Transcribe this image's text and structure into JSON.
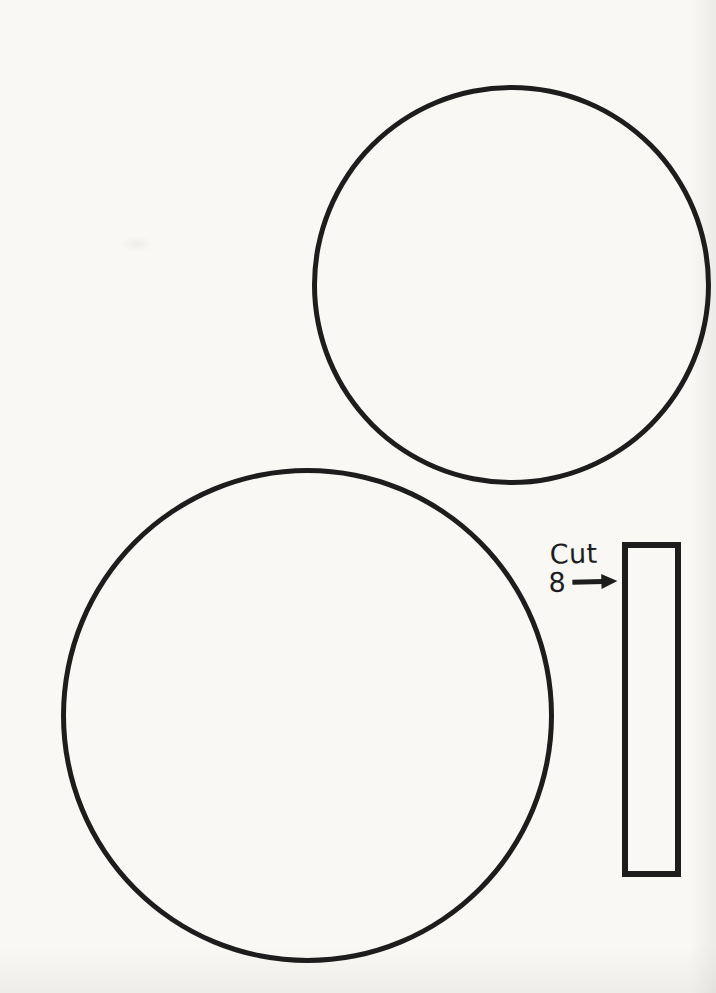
{
  "colors": {
    "paper": "#f9f8f5",
    "ink": "#1d1d1d"
  },
  "annotation": {
    "word": "Cut",
    "count": "8"
  },
  "pieces": {
    "top_circle": "blank circular pattern piece (smaller)",
    "bottom_circle": "blank circular pattern piece (larger)",
    "strip": "tall rectangular strip pattern piece, cut 8 times"
  }
}
